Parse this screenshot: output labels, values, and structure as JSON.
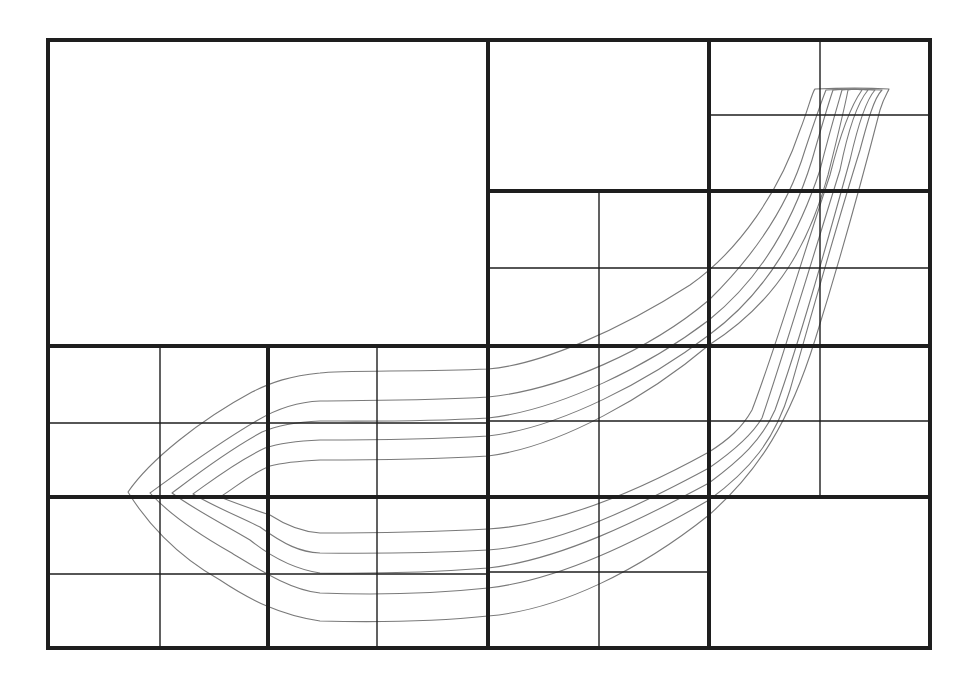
{
  "diagram": {
    "title": "",
    "colors": {
      "background": "#ffffff",
      "grid_line": "#1e1e1e",
      "curve": "#7a7a7a"
    },
    "outer_frame": {
      "x": 48,
      "y": 40,
      "width": 882,
      "height": 608
    },
    "thick_lines": [
      {
        "x1": 488,
        "y1": 40,
        "x2": 488,
        "y2": 648
      },
      {
        "x1": 48,
        "y1": 346,
        "x2": 930,
        "y2": 346
      },
      {
        "x1": 709,
        "y1": 40,
        "x2": 709,
        "y2": 648
      },
      {
        "x1": 488,
        "y1": 191,
        "x2": 930,
        "y2": 191
      },
      {
        "x1": 268,
        "y1": 346,
        "x2": 268,
        "y2": 648
      },
      {
        "x1": 48,
        "y1": 497,
        "x2": 930,
        "y2": 497
      }
    ],
    "thin_lines": [
      {
        "x1": 820,
        "y1": 40,
        "x2": 820,
        "y2": 497
      },
      {
        "x1": 709,
        "y1": 115,
        "x2": 930,
        "y2": 115
      },
      {
        "x1": 599,
        "y1": 191,
        "x2": 599,
        "y2": 648
      },
      {
        "x1": 488,
        "y1": 268,
        "x2": 930,
        "y2": 268
      },
      {
        "x1": 488,
        "y1": 421,
        "x2": 930,
        "y2": 421
      },
      {
        "x1": 488,
        "y1": 572,
        "x2": 709,
        "y2": 572
      },
      {
        "x1": 160,
        "y1": 346,
        "x2": 160,
        "y2": 648
      },
      {
        "x1": 377,
        "y1": 346,
        "x2": 377,
        "y2": 648
      },
      {
        "x1": 48,
        "y1": 423,
        "x2": 488,
        "y2": 423
      },
      {
        "x1": 48,
        "y1": 574,
        "x2": 488,
        "y2": 574
      }
    ],
    "curves": [
      {
        "name": "streamline-1",
        "d": "M 815 89 C 812 92, 808 110, 800 130 C 780 190, 740 250, 690 285 C 620 330, 540 365, 488 369 C 420 372, 340 370, 320 373 C 290 376, 272 382, 252 392 C 200 420, 150 460, 128 492 C 145 520, 175 555, 220 580 C 250 600, 280 615, 320 621 C 400 623, 450 620, 488 616 C 560 610, 640 570, 709 515 C 760 470, 790 420, 815 340 C 840 260, 862 180, 880 110 C 884 97, 888 92, 889 89 C 870 88, 840 88, 815 89 Z"
      },
      {
        "name": "streamline-2",
        "d": "M 826 90 C 822 100, 815 120, 805 150 C 790 200, 760 250, 709 300 C 650 350, 560 390, 488 397 C 420 401, 360 400, 320 401 C 295 402, 275 410, 258 420 C 215 445, 175 475, 150 493 C 170 515, 200 535, 230 552 C 260 570, 290 590, 320 593 C 400 596, 450 592, 488 588 C 560 580, 640 540, 709 500 C 750 470, 775 440, 790 390 C 810 320, 835 230, 860 150 C 868 120, 874 98, 882 90 C 860 89, 840 89, 826 90 Z"
      },
      {
        "name": "streamline-3",
        "d": "M 833 90 C 829 102, 822 125, 812 160 C 795 215, 765 275, 709 320 C 650 365, 560 410, 488 418 C 420 422, 360 421, 320 421 C 295 422, 278 425, 262 432 C 225 452, 192 478, 172 493 C 195 510, 225 525, 250 540 C 275 560, 300 570, 320 573 C 400 574, 450 571, 488 568 C 560 560, 640 520, 709 483 C 740 460, 762 440, 775 410 C 800 340, 825 250, 850 160 C 858 125, 866 100, 875 90 C 860 89, 845 89, 833 90 Z"
      },
      {
        "name": "streamline-4",
        "d": "M 842 90 C 838 104, 830 130, 820 170 C 800 230, 770 290, 709 335 C 650 380, 560 428, 488 436 C 420 440, 360 440, 320 440 C 295 441, 280 443, 265 448 C 235 462, 210 482, 193 494 C 215 507, 240 517, 260 527 C 285 545, 300 552, 320 553 C 400 554, 450 552, 488 550 C 560 545, 640 505, 709 468 C 735 450, 752 435, 762 418 C 785 350, 812 260, 840 170 C 848 130, 858 102, 868 90 C 860 89, 850 89, 842 90 Z"
      },
      {
        "name": "streamline-5",
        "d": "M 848 90 C 845 106, 838 135, 828 175 C 810 240, 780 300, 709 345 C 650 395, 560 447, 488 456 C 420 460, 360 460, 320 460 C 300 461, 285 462, 270 466 C 250 474, 235 488, 220 497 C 240 505, 255 510, 270 515 C 290 528, 305 532, 320 533 C 400 533, 450 531, 488 529 C 560 525, 640 490, 709 452 C 728 440, 742 428, 752 410 C 775 350, 800 265, 830 175 C 840 135, 852 104, 862 90 C 857 89, 852 89, 848 90 Z"
      }
    ]
  }
}
